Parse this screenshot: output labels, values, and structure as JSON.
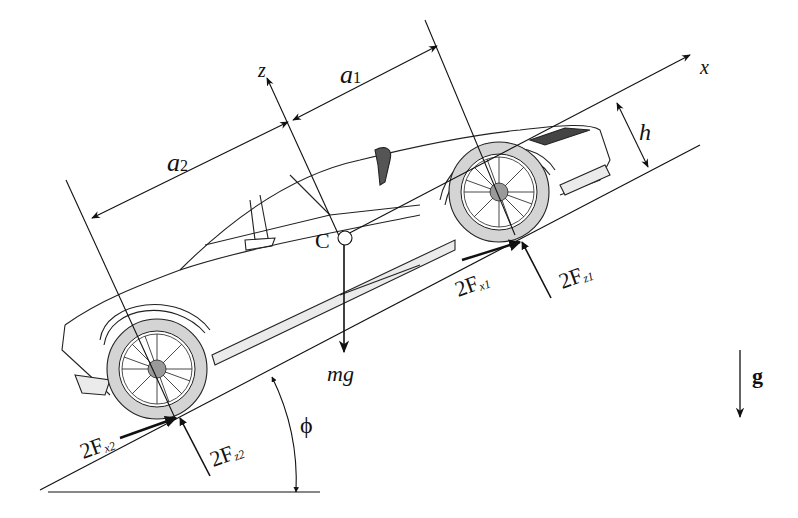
{
  "diagram": {
    "axes": {
      "x_label": "x",
      "z_label": "z"
    },
    "dimensions": {
      "a1": "a",
      "a1_sub": "1",
      "a2": "a",
      "a2_sub": "2",
      "h": "h"
    },
    "center_of_mass": "C",
    "forces": {
      "weight": "mg",
      "front_traction": {
        "main": "2F",
        "sub": "x1"
      },
      "front_normal": {
        "main": "2F",
        "sub": "z1"
      },
      "rear_traction": {
        "main": "2F",
        "sub": "x2"
      },
      "rear_normal": {
        "main": "2F",
        "sub": "z2"
      }
    },
    "incline_angle": "ϕ",
    "gravity": "g",
    "colors": {
      "line": "#111111",
      "tire": "#d4d4d4",
      "hub": "#9a9a9a",
      "trim": "#ebebeb"
    }
  }
}
